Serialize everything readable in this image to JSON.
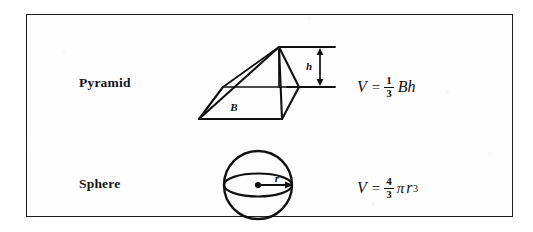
{
  "figure": {
    "kind": "geometry-reference-table",
    "border_color": "#1c1c1c",
    "ink_color": "#111111",
    "background": "#ffffff",
    "rows": [
      {
        "id": "pyramid",
        "label": "Pyramid",
        "shape": "square-pyramid",
        "dimension_labels": [
          {
            "name": "base-label",
            "text": "B",
            "meaning": "area of base"
          },
          {
            "name": "height-label",
            "text": "h",
            "meaning": "height"
          }
        ],
        "formula": {
          "lhs": "V",
          "equals": "=",
          "numerator": "1",
          "denominator": "3",
          "rest": "Bh"
        }
      },
      {
        "id": "sphere",
        "label": "Sphere",
        "shape": "sphere-with-equator",
        "dimension_labels": [
          {
            "name": "radius-label",
            "text": "r",
            "meaning": "radius"
          }
        ],
        "formula": {
          "lhs": "V",
          "equals": "=",
          "numerator": "4",
          "denominator": "3",
          "pi": "π",
          "rest": "r",
          "exponent": "3"
        }
      }
    ]
  }
}
